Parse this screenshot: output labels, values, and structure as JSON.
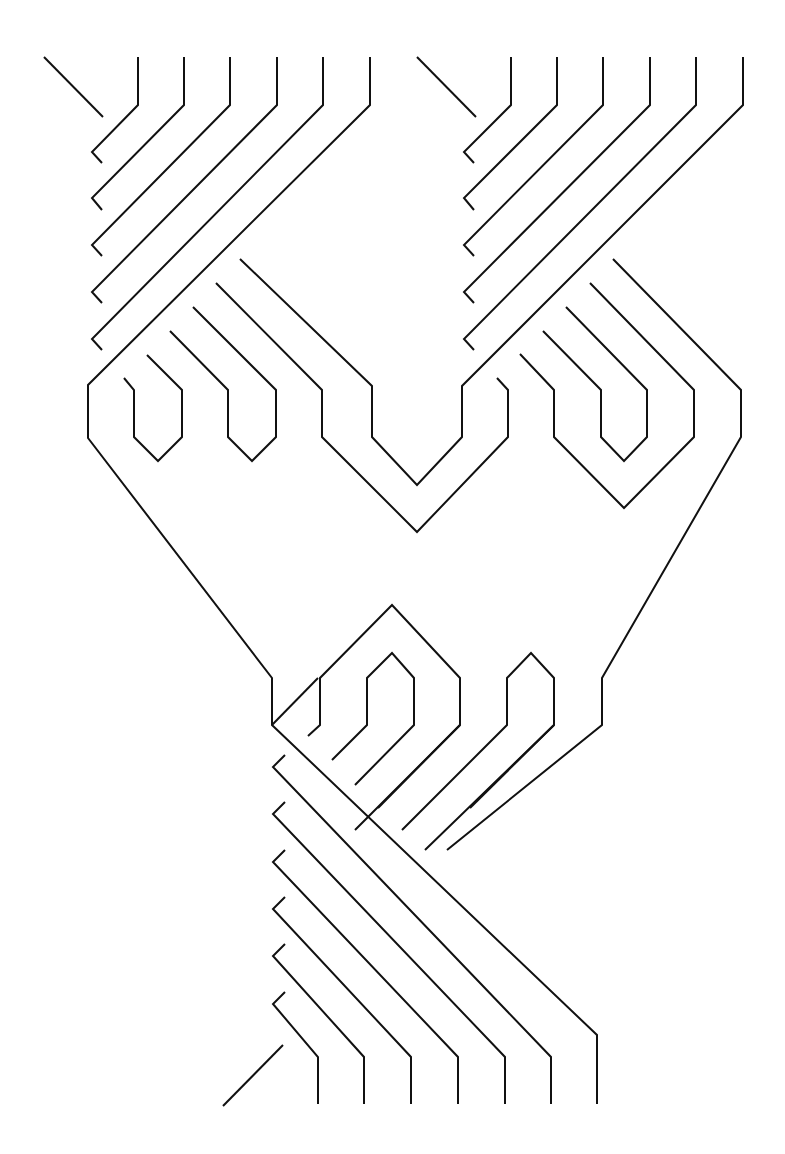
{
  "diagram": {
    "type": "braid-line-drawing",
    "width": 785,
    "height": 1154,
    "background": "#ffffff",
    "stroke_color": "#111111",
    "stroke_width": 2,
    "regions": [
      {
        "name": "top-left-bundle",
        "strands": [
          [
            [
              44,
              57
            ],
            [
              103,
              117
            ]
          ],
          [
            [
              138,
              57
            ],
            [
              138,
              105
            ],
            [
              92,
              152
            ],
            [
              102,
              163
            ]
          ],
          [
            [
              184,
              57
            ],
            [
              184,
              105
            ],
            [
              92,
              198
            ],
            [
              102,
              210
            ]
          ],
          [
            [
              230,
              57
            ],
            [
              230,
              105
            ],
            [
              92,
              245
            ],
            [
              102,
              256
            ]
          ],
          [
            [
              277,
              57
            ],
            [
              277,
              105
            ],
            [
              92,
              292
            ],
            [
              102,
              303
            ]
          ],
          [
            [
              323,
              57
            ],
            [
              323,
              105
            ],
            [
              92,
              339
            ],
            [
              102,
              350
            ]
          ],
          [
            [
              370,
              57
            ],
            [
              370,
              105
            ],
            [
              88,
              385
            ],
            [
              88,
              438
            ],
            [
              272,
              678
            ],
            [
              272,
              725
            ],
            [
              582,
              1037
            ]
          ]
        ]
      },
      {
        "name": "top-right-bundle",
        "strands": [
          [
            [
              417,
              57
            ],
            [
              476,
              117
            ]
          ],
          [
            [
              511,
              57
            ],
            [
              511,
              105
            ],
            [
              464,
              152
            ],
            [
              474,
              163
            ]
          ],
          [
            [
              557,
              57
            ],
            [
              557,
              105
            ],
            [
              464,
              198
            ],
            [
              474,
              210
            ]
          ],
          [
            [
              603,
              57
            ],
            [
              603,
              105
            ],
            [
              464,
              245
            ],
            [
              474,
              256
            ]
          ],
          [
            [
              650,
              57
            ],
            [
              650,
              105
            ],
            [
              464,
              292
            ],
            [
              474,
              303
            ]
          ],
          [
            [
              696,
              57
            ],
            [
              696,
              105
            ],
            [
              464,
              339
            ],
            [
              474,
              350
            ]
          ],
          [
            [
              743,
              57
            ],
            [
              743,
              105
            ],
            [
              460,
              386
            ],
            [
              460,
              437
            ],
            [
              417,
              485
            ],
            [
              370,
              437
            ],
            [
              370,
              386
            ],
            [
              240,
              259
            ]
          ]
        ]
      },
      {
        "name": "left-loops",
        "strands": [
          [
            [
              124,
              378
            ],
            [
              134,
              390
            ],
            [
              134,
              437
            ],
            [
              159,
              461
            ],
            [
              182,
              437
            ],
            [
              182,
              390
            ],
            [
              147,
              355
            ]
          ],
          [
            [
              217,
              332
            ],
            [
              228,
              344
            ],
            [
              228,
              437
            ],
            [
              253,
              461
            ],
            [
              276,
              437
            ],
            [
              276,
              390
            ],
            [
              216,
              318
            ]
          ]
        ]
      },
      {
        "name": "middle-v-loops",
        "strands": [
          [
            [
              217,
              302
            ],
            [
              322,
              390
            ],
            [
              322,
              437
            ],
            [
              417,
              532
            ],
            [
              508,
              437
            ],
            [
              508,
              390
            ],
            [
              497,
              378
            ]
          ],
          [
            [
              540,
              354
            ],
            [
              554,
              390
            ],
            [
              554,
              437
            ],
            [
              623,
              508
            ],
            [
              646,
              508
            ]
          ]
        ]
      },
      {
        "name": "right-loops",
        "strands": [
          [
            [
              519,
              354
            ],
            [
              554,
              390
            ],
            [
              554,
              437
            ],
            [
              624,
              508
            ],
            [
              694,
              437
            ],
            [
              694,
              390
            ],
            [
              588,
              282
            ]
          ],
          [
            [
              543,
              308
            ],
            [
              601,
              390
            ],
            [
              601,
              437
            ],
            [
              624,
              461
            ],
            [
              647,
              437
            ],
            [
              647,
              390
            ],
            [
              566,
              319
            ]
          ],
          [
            [
              612,
              262
            ],
            [
              741,
              390
            ],
            [
              741,
              437
            ],
            [
              601,
              678
            ],
            [
              601,
              725
            ],
            [
              447,
              850
            ]
          ]
        ]
      },
      {
        "name": "lower-hexagon-loops",
        "strands": [
          [
            [
              308,
              736
            ],
            [
              320,
              725
            ],
            [
              320,
              678
            ],
            [
              392,
              605
            ],
            [
              460,
              678
            ],
            [
              460,
              725
            ],
            [
              308,
              850
            ]
          ],
          [
            [
              332,
              760
            ],
            [
              367,
              725
            ],
            [
              367,
              678
            ],
            [
              392,
              653
            ],
            [
              414,
              678
            ],
            [
              414,
              725
            ],
            [
              355,
              785
            ]
          ],
          [
            [
              378,
              808
            ],
            [
              414,
              772
            ]
          ],
          [
            [
              402,
              830
            ],
            [
              507,
              725
            ],
            [
              507,
              678
            ],
            [
              531,
              653
            ],
            [
              554,
              678
            ],
            [
              554,
              725
            ],
            [
              447,
              830
            ]
          ]
        ]
      },
      {
        "name": "bottom-bundle",
        "strands": [
          [
            [
              285,
              752
            ],
            [
              272,
              765
            ],
            [
              598,
              1037
            ],
            [
              598,
              1104
            ]
          ],
          [
            [
              285,
              798
            ],
            [
              272,
              810
            ],
            [
              505,
              1005
            ],
            [
              505,
              1104
            ]
          ],
          [
            [
              285,
              845
            ],
            [
              272,
              857
            ],
            [
              551,
              1037
            ],
            [
              551,
              1104
            ]
          ],
          [
            [
              285,
              892
            ],
            [
              272,
              904
            ],
            [
              457,
              1057
            ],
            [
              457,
              1104
            ]
          ],
          [
            [
              285,
              939
            ],
            [
              272,
              951
            ],
            [
              411,
              1057
            ],
            [
              411,
              1104
            ]
          ],
          [
            [
              285,
              987
            ],
            [
              272,
              998
            ],
            [
              364,
              1057
            ],
            [
              364,
              1104
            ]
          ],
          [
            [
              283,
              1034
            ],
            [
              272,
              1045
            ],
            [
              318,
              1057
            ],
            [
              318,
              1104
            ]
          ],
          [
            [
              283,
              1045
            ],
            [
              223,
              1106
            ]
          ]
        ]
      }
    ]
  }
}
